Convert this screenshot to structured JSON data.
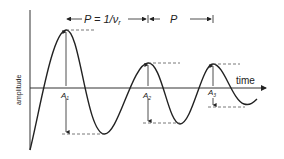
{
  "diagram": {
    "y_axis_label": "amplitude",
    "x_axis_label": "time",
    "period_label_1": "P = 1/ν",
    "period_label_1_sub": "r",
    "period_label_2": "P",
    "amplitude_labels": [
      {
        "name": "A",
        "sub": "1"
      },
      {
        "name": "A",
        "sub": "2"
      },
      {
        "name": "A",
        "sub": "3"
      }
    ],
    "colors": {
      "line": "#222222",
      "dash": "#555555",
      "background": "#ffffff"
    }
  }
}
